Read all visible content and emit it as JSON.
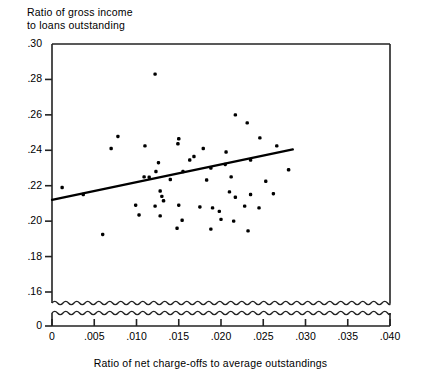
{
  "chart_data": {
    "type": "scatter",
    "title": "",
    "ylabel": "Ratio of gross income\nto loans outstanding",
    "xlabel": "Ratio of net charge-offs to average outstandings",
    "xlim": [
      0,
      0.04
    ],
    "ylim": [
      0.155,
      0.3
    ],
    "y_axis_break": true,
    "y_break_note": "wavy break below .16 down to baseline 0",
    "grid": false,
    "legend": null,
    "xticks": [
      0,
      0.005,
      0.01,
      0.015,
      0.02,
      0.025,
      0.03,
      0.035,
      0.04
    ],
    "xticklabels": [
      "0",
      ".005",
      ".010",
      ".015",
      ".020",
      ".025",
      ".030",
      ".035",
      ".040"
    ],
    "yticks": [
      0.16,
      0.18,
      0.2,
      0.22,
      0.24,
      0.26,
      0.28,
      0.3
    ],
    "yticklabels": [
      ".16",
      ".18",
      ".20",
      ".22",
      ".24",
      ".26",
      ".28",
      ".30"
    ],
    "y_baseline_label": "0",
    "points": [
      {
        "x": 0.0122,
        "y": 0.283
      },
      {
        "x": 0.0217,
        "y": 0.26
      },
      {
        "x": 0.0231,
        "y": 0.2555
      },
      {
        "x": 0.0078,
        "y": 0.2478
      },
      {
        "x": 0.015,
        "y": 0.2465
      },
      {
        "x": 0.0149,
        "y": 0.2437
      },
      {
        "x": 0.007,
        "y": 0.241
      },
      {
        "x": 0.011,
        "y": 0.2425
      },
      {
        "x": 0.0179,
        "y": 0.241
      },
      {
        "x": 0.0246,
        "y": 0.247
      },
      {
        "x": 0.0168,
        "y": 0.2365
      },
      {
        "x": 0.0206,
        "y": 0.239
      },
      {
        "x": 0.0266,
        "y": 0.2425
      },
      {
        "x": 0.0126,
        "y": 0.233
      },
      {
        "x": 0.0163,
        "y": 0.2345
      },
      {
        "x": 0.0205,
        "y": 0.232
      },
      {
        "x": 0.0235,
        "y": 0.2345
      },
      {
        "x": 0.0123,
        "y": 0.228
      },
      {
        "x": 0.0155,
        "y": 0.228
      },
      {
        "x": 0.0188,
        "y": 0.23
      },
      {
        "x": 0.028,
        "y": 0.229
      },
      {
        "x": 0.0109,
        "y": 0.225
      },
      {
        "x": 0.0115,
        "y": 0.2248
      },
      {
        "x": 0.014,
        "y": 0.2235
      },
      {
        "x": 0.0183,
        "y": 0.2232
      },
      {
        "x": 0.0212,
        "y": 0.225
      },
      {
        "x": 0.0253,
        "y": 0.2225
      },
      {
        "x": 0.0012,
        "y": 0.219
      },
      {
        "x": 0.0037,
        "y": 0.215
      },
      {
        "x": 0.0128,
        "y": 0.217
      },
      {
        "x": 0.013,
        "y": 0.214
      },
      {
        "x": 0.0132,
        "y": 0.2115
      },
      {
        "x": 0.021,
        "y": 0.2165
      },
      {
        "x": 0.0217,
        "y": 0.2135
      },
      {
        "x": 0.0235,
        "y": 0.215
      },
      {
        "x": 0.0262,
        "y": 0.2155
      },
      {
        "x": 0.0099,
        "y": 0.209
      },
      {
        "x": 0.0122,
        "y": 0.2085
      },
      {
        "x": 0.015,
        "y": 0.209
      },
      {
        "x": 0.0175,
        "y": 0.208
      },
      {
        "x": 0.019,
        "y": 0.2075
      },
      {
        "x": 0.0198,
        "y": 0.2055
      },
      {
        "x": 0.0228,
        "y": 0.2085
      },
      {
        "x": 0.0245,
        "y": 0.2075
      },
      {
        "x": 0.0103,
        "y": 0.2035
      },
      {
        "x": 0.0128,
        "y": 0.203
      },
      {
        "x": 0.0154,
        "y": 0.2005
      },
      {
        "x": 0.02,
        "y": 0.201
      },
      {
        "x": 0.0215,
        "y": 0.2
      },
      {
        "x": 0.006,
        "y": 0.1925
      },
      {
        "x": 0.0148,
        "y": 0.196
      },
      {
        "x": 0.0188,
        "y": 0.1955
      },
      {
        "x": 0.0232,
        "y": 0.1945
      }
    ],
    "fit_line": {
      "type": "linear-regression",
      "x_start": 0.0,
      "y_start": 0.212,
      "x_end": 0.0285,
      "y_end": 0.2405
    }
  }
}
